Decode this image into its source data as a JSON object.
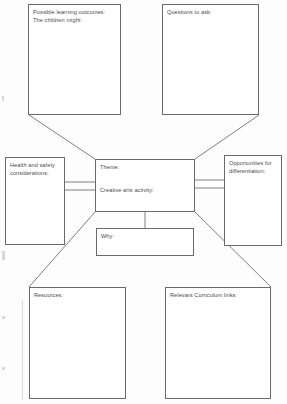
{
  "document": {
    "title": "Creative arts activity planning template",
    "type": "mind-map worksheet",
    "background_color": "#fdfdfd",
    "line_color": "#6a6a6a",
    "text_color": "#4a4a4a"
  },
  "boxes": {
    "outcomes": {
      "line1": "Possible learning outcomes:",
      "line2": "The children might:"
    },
    "questions": {
      "line1": "Questions to ask:"
    },
    "health": {
      "line1": "Health and safety",
      "line2": "considerations:"
    },
    "opportunities": {
      "line1": "Opportunities for",
      "line2": "differentiation:"
    },
    "center": {
      "line1": "Theme:",
      "line2": "Creative arts activity:"
    },
    "why": {
      "line1": "Why:"
    },
    "resources": {
      "line1": "Resources:"
    },
    "curriculum": {
      "line1": "Relevant Curriculum links:"
    }
  }
}
